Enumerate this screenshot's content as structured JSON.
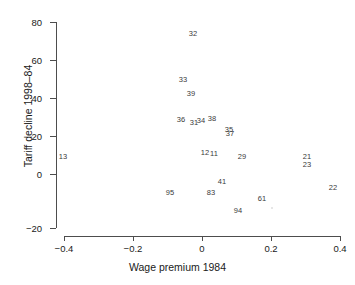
{
  "chart_data": {
    "type": "scatter",
    "title": "",
    "xlabel": "Wage premium 1984",
    "ylabel": "Tariff decline 1998–84",
    "xlim": [
      -0.47,
      0.49
    ],
    "ylim": [
      -24,
      84
    ],
    "grid": false,
    "legend": null,
    "xticks": [
      {
        "value": -0.4,
        "label": "−0.4",
        "px": 64
      },
      {
        "value": -0.2,
        "label": "−0.2",
        "px": 133
      },
      {
        "value": 0,
        "label": "0",
        "px": 202
      },
      {
        "value": 0.2,
        "label": "0.2",
        "px": 271
      },
      {
        "value": 0.4,
        "label": "0.4",
        "px": 340
      }
    ],
    "yticks": [
      {
        "value": 80,
        "label": "80",
        "px": 22
      },
      {
        "value": 60,
        "label": "60",
        "px": 60
      },
      {
        "value": 40,
        "label": "40",
        "px": 98
      },
      {
        "value": 20,
        "label": "20",
        "px": 136
      },
      {
        "value": 0,
        "label": "0",
        "px": 174
      },
      {
        "value": -20,
        "label": "−20",
        "px": 228
      }
    ],
    "marker_style": "text-labels",
    "points": [
      {
        "label": "32",
        "x": 0.022,
        "y": 72.0,
        "px": 193,
        "py": 34
      },
      {
        "label": "33",
        "x": -0.035,
        "y": 48.0,
        "px": 183,
        "py": 80
      },
      {
        "label": "39",
        "x": -0.01,
        "y": 42.5,
        "px": 191,
        "py": 94
      },
      {
        "label": "36",
        "x": -0.045,
        "y": 28.0,
        "px": 181,
        "py": 120
      },
      {
        "label": "31",
        "x": 0.0,
        "y": 26.5,
        "px": 194,
        "py": 123
      },
      {
        "label": "34",
        "x": 0.012,
        "y": 27.5,
        "px": 201,
        "py": 121
      },
      {
        "label": "38",
        "x": 0.058,
        "y": 28.0,
        "px": 212,
        "py": 119
      },
      {
        "label": "35",
        "x": 0.105,
        "y": 23.5,
        "px": 229,
        "py": 130
      },
      {
        "label": "37",
        "x": 0.107,
        "y": 22.0,
        "px": 230,
        "py": 134
      },
      {
        "label": "12",
        "x": 0.036,
        "y": 12.0,
        "px": 205,
        "py": 153
      },
      {
        "label": "11",
        "x": 0.058,
        "y": 11.5,
        "px": 214,
        "py": 154
      },
      {
        "label": "29",
        "x": 0.137,
        "y": 10.0,
        "px": 242,
        "py": 157
      },
      {
        "label": "13",
        "x": -0.355,
        "y": 10.5,
        "px": 63,
        "py": 157
      },
      {
        "label": "21",
        "x": 0.345,
        "y": 10.5,
        "px": 307,
        "py": 157
      },
      {
        "label": "23",
        "x": 0.345,
        "y": 7.5,
        "px": 307,
        "py": 165
      },
      {
        "label": "22",
        "x": 0.435,
        "y": 1.5,
        "px": 333,
        "py": 188
      },
      {
        "label": "41",
        "x": 0.078,
        "y": 3.0,
        "px": 222,
        "py": 182
      },
      {
        "label": "83",
        "x": 0.048,
        "y": -1.0,
        "px": 211,
        "py": 193
      },
      {
        "label": "95",
        "x": -0.085,
        "y": -1.5,
        "px": 170,
        "py": 193
      },
      {
        "label": "61",
        "x": 0.202,
        "y": -3.5,
        "px": 262,
        "py": 199
      },
      {
        "label": "94",
        "x": 0.098,
        "y": -9.5,
        "px": 238,
        "py": 211
      }
    ],
    "unlabeled_points": [
      {
        "px": 272,
        "py": 208
      }
    ]
  }
}
